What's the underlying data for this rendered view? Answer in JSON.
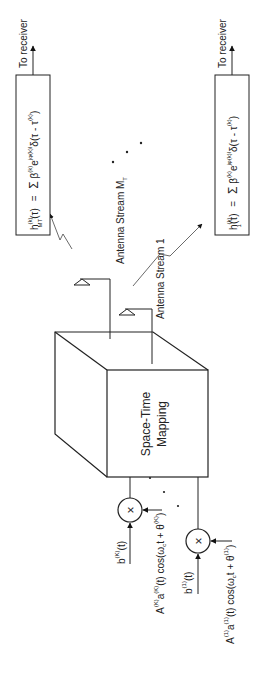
{
  "diagram": {
    "orientation": "rotated -90deg (text reads bottom-to-top)",
    "central_block": {
      "label_line1": "Space-Time",
      "label_line2": "Mapping"
    },
    "antenna_streams": [
      {
        "id": "mt",
        "label": "Antenna Stream M",
        "label_sub": "T"
      },
      {
        "id": "one",
        "label": "Antenna Stream 1"
      }
    ],
    "channel_boxes": [
      {
        "id": "mt",
        "lhs": "h",
        "lhs_sup": "(k)",
        "lhs_sub": "MT",
        "lhs_arg": "(τ)",
        "eq": "=",
        "sum": "Σ",
        "sum_upper": "L",
        "sum_lower": "l=1",
        "beta": "β",
        "beta_sup": "(k)",
        "beta_sub": "l",
        "exp": "e",
        "exp_sup": "jφ(k)l",
        "delta": "δ(τ - τ",
        "tau_sup": "(k)",
        "tau_sub": "l",
        "close": ")",
        "output_label": "To receiver"
      },
      {
        "id": "one",
        "lhs": "h",
        "lhs_sup": "(k)",
        "lhs_sub": "1",
        "lhs_arg": "(τ)",
        "eq": "=",
        "sum": "Σ",
        "sum_upper": "L",
        "sum_lower": "l=1",
        "beta": "β",
        "beta_sup": "(k)",
        "beta_sub": "l",
        "exp": "e",
        "exp_sup": "jφ(k)l",
        "delta": "δ(τ - τ",
        "tau_sup": "(k)",
        "tau_sub": "l",
        "close": ")",
        "output_label": "To receiver"
      }
    ],
    "inputs": [
      {
        "id": "K",
        "data_label": "b",
        "data_sup": "(K)",
        "data_arg": "(t)",
        "carrier": "A",
        "carrier_sup": "(K)",
        "carrier_mid": "a",
        "carrier_mid_sup": "(K)",
        "carrier_rest": "(t) cos(ω",
        "carrier_c": "c",
        "carrier_end": "t + θ",
        "carrier_end_sup": "(K)",
        "carrier_close": ")",
        "mult_symbol": "×"
      },
      {
        "id": "1",
        "data_label": "b",
        "data_sup": "(1)",
        "data_arg": "(t)",
        "carrier": "A",
        "carrier_sup": "(1)",
        "carrier_mid": "a",
        "carrier_mid_sup": "(1)",
        "carrier_rest": "(t) cos(ω",
        "carrier_c": "c",
        "carrier_end": "t + θ",
        "carrier_end_sup": "(1)",
        "carrier_close": ")",
        "mult_symbol": "×"
      }
    ],
    "ellipsis": "· · ·"
  }
}
